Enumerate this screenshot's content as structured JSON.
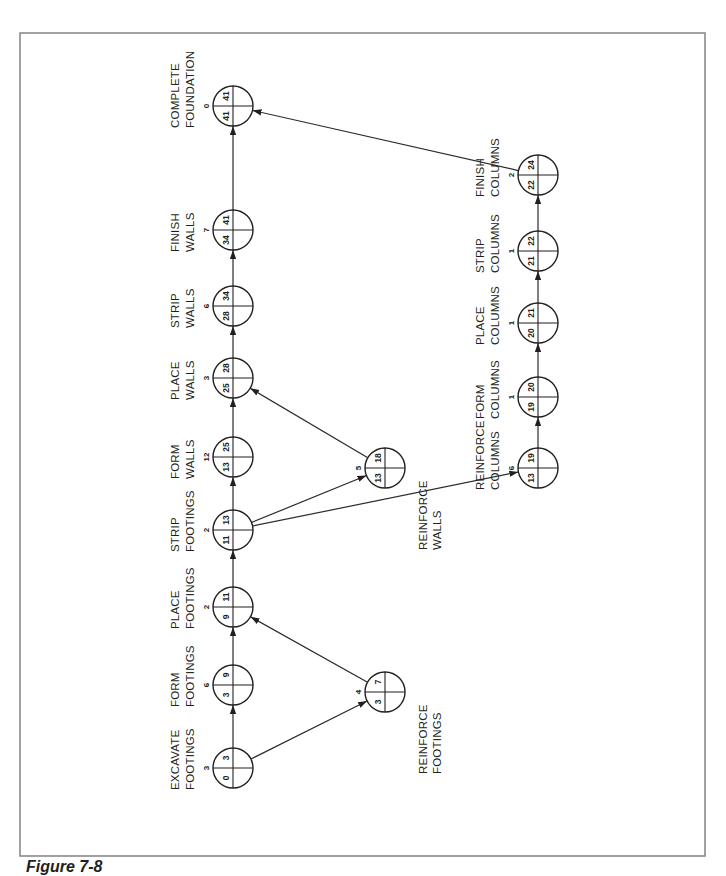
{
  "figure": {
    "caption": "Figure 7-8",
    "orientation": "rotated 90 degrees counter-clockwise"
  },
  "colors": {
    "line": "#231f20",
    "frame": "#8a8a8a",
    "background": "#ffffff"
  },
  "nodes": [
    {
      "id": "excavate_footings",
      "label1": "EXCAVATE",
      "label2": "FOOTINGS",
      "duration": "3",
      "es": "0",
      "ef": "3",
      "label_side": "left"
    },
    {
      "id": "form_footings",
      "label1": "FORM",
      "label2": "FOOTINGS",
      "duration": "6",
      "es": "3",
      "ef": "9",
      "label_side": "left"
    },
    {
      "id": "place_footings",
      "label1": "PLACE",
      "label2": "FOOTINGS",
      "duration": "2",
      "es": "9",
      "ef": "11",
      "label_side": "left"
    },
    {
      "id": "strip_footings",
      "label1": "STRIP",
      "label2": "FOOTINGS",
      "duration": "2",
      "es": "11",
      "ef": "13",
      "label_side": "left"
    },
    {
      "id": "form_walls",
      "label1": "FORM",
      "label2": "WALLS",
      "duration": "12",
      "es": "13",
      "ef": "25",
      "label_side": "left"
    },
    {
      "id": "place_walls",
      "label1": "PLACE",
      "label2": "WALLS",
      "duration": "3",
      "es": "25",
      "ef": "28",
      "label_side": "left"
    },
    {
      "id": "strip_walls",
      "label1": "STRIP",
      "label2": "WALLS",
      "duration": "6",
      "es": "28",
      "ef": "34",
      "label_side": "left"
    },
    {
      "id": "finish_walls",
      "label1": "FINISH",
      "label2": "WALLS",
      "duration": "7",
      "es": "34",
      "ef": "41",
      "label_side": "left"
    },
    {
      "id": "complete_foundation",
      "label1": "COMPLETE",
      "label2": "FOUNDATION",
      "duration": "0",
      "es": "41",
      "ef": "41",
      "label_side": "left"
    },
    {
      "id": "reinforce_footings",
      "label1": "REINFORCE",
      "label2": "FOOTINGS",
      "duration": "4",
      "es": "3",
      "ef": "7",
      "label_side": "right"
    },
    {
      "id": "reinforce_walls",
      "label1": "REINFORCE",
      "label2": "WALLS",
      "duration": "5",
      "es": "13",
      "ef": "18",
      "label_side": "right"
    },
    {
      "id": "reinforce_columns",
      "label1": "REINFORCE",
      "label2": "COLUMNS",
      "duration": "6",
      "es": "13",
      "ef": "19",
      "label_side": "left"
    },
    {
      "id": "form_columns",
      "label1": "FORM",
      "label2": "COLUMNS",
      "duration": "1",
      "es": "19",
      "ef": "20",
      "label_side": "left"
    },
    {
      "id": "place_columns",
      "label1": "PLACE",
      "label2": "COLUMNS",
      "duration": "1",
      "es": "20",
      "ef": "21",
      "label_side": "left"
    },
    {
      "id": "strip_columns",
      "label1": "STRIP",
      "label2": "COLUMNS",
      "duration": "1",
      "es": "21",
      "ef": "22",
      "label_side": "left"
    },
    {
      "id": "finish_columns",
      "label1": "FINISH",
      "label2": "COLUMNS",
      "duration": "2",
      "es": "22",
      "ef": "24",
      "label_side": "left"
    }
  ],
  "edges": [
    [
      "excavate_footings",
      "form_footings"
    ],
    [
      "excavate_footings",
      "reinforce_footings"
    ],
    [
      "form_footings",
      "place_footings"
    ],
    [
      "reinforce_footings",
      "place_footings"
    ],
    [
      "place_footings",
      "strip_footings"
    ],
    [
      "strip_footings",
      "form_walls"
    ],
    [
      "strip_footings",
      "reinforce_walls"
    ],
    [
      "strip_footings",
      "reinforce_columns"
    ],
    [
      "form_walls",
      "place_walls"
    ],
    [
      "reinforce_walls",
      "place_walls"
    ],
    [
      "place_walls",
      "strip_walls"
    ],
    [
      "strip_walls",
      "finish_walls"
    ],
    [
      "finish_walls",
      "complete_foundation"
    ],
    [
      "reinforce_columns",
      "form_columns"
    ],
    [
      "form_columns",
      "place_columns"
    ],
    [
      "place_columns",
      "strip_columns"
    ],
    [
      "strip_columns",
      "finish_columns"
    ],
    [
      "finish_columns",
      "complete_foundation"
    ]
  ]
}
